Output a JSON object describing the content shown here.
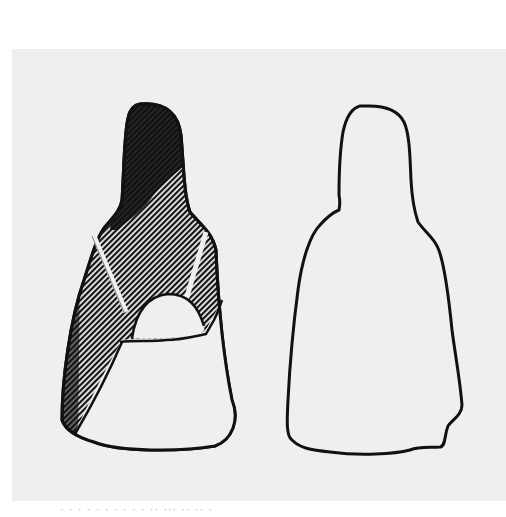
{
  "figure": {
    "panels": [
      {
        "id": "left",
        "description": "figurine drawing with hatched shading",
        "style": "hatched"
      },
      {
        "id": "right",
        "description": "figurine outline drawing",
        "style": "outline"
      }
    ],
    "colors": {
      "background": "#efefef",
      "ink": "#111111",
      "paper": "#ffffff"
    }
  },
  "caption": {
    "text": "· · ·  · · ·  · ·  · · ·· ··· ·· ·· ·"
  }
}
